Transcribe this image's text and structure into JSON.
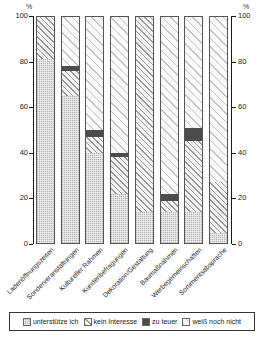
{
  "chart_data": {
    "type": "bar",
    "subtype": "stacked-100-percent",
    "title": "",
    "xlabel": "",
    "ylabel": "%",
    "ylabel_right": "%",
    "ylim": [
      0,
      100
    ],
    "yticks": [
      0,
      20,
      40,
      60,
      80,
      100
    ],
    "ytick_labels": [
      "0",
      "20",
      "40",
      "60",
      "80",
      "100"
    ],
    "yticks_right": [
      0,
      20,
      40,
      60,
      80,
      100
    ],
    "ytick_labels_right": [
      "0",
      "20",
      "40",
      "60",
      "80",
      "100"
    ],
    "grid": false,
    "legend_position": "bottom",
    "categories": [
      "Ladenöffnungszeiten",
      "Sonderveranstaltungen",
      "Kultureller Rahmen",
      "Kundenbefragungen",
      "Dekoration/Gestaltung",
      "Baumaßnahmen",
      "Werbegemeinschaften",
      "Sortimentsabsprache"
    ],
    "series": [
      {
        "name": "unterstütze ich",
        "pattern": "grey-stipple",
        "color": "#b5b5b5",
        "values": [
          81,
          65,
          40,
          22,
          14,
          14,
          14,
          5
        ]
      },
      {
        "name": "kein Interesse",
        "pattern": "diagonal-hatch",
        "color": "#f2f2f2",
        "values": [
          19,
          11,
          7,
          16,
          86,
          5,
          31,
          22
        ]
      },
      {
        "name": "zu teuer",
        "pattern": "solid-dark",
        "color": "#4c4c4c",
        "values": [
          0,
          2,
          3,
          2,
          0,
          3,
          6,
          0
        ]
      },
      {
        "name": "weiß noch nicht",
        "pattern": "light-diagonal-hatch",
        "color": "#fafafa",
        "values": [
          0,
          22,
          50,
          60,
          0,
          78,
          49,
          73
        ]
      }
    ]
  },
  "legend": {
    "items": [
      {
        "label": "unterstütze ich",
        "swatch": "grey-stipple"
      },
      {
        "label": "kein Interesse",
        "swatch": "diagonal-hatch"
      },
      {
        "label": "zu teuer",
        "swatch": "solid-dark"
      },
      {
        "label": "weiß noch nicht",
        "swatch": "light-diagonal-hatch"
      }
    ]
  },
  "axes": {
    "left_unit": "%",
    "right_unit": "%"
  }
}
